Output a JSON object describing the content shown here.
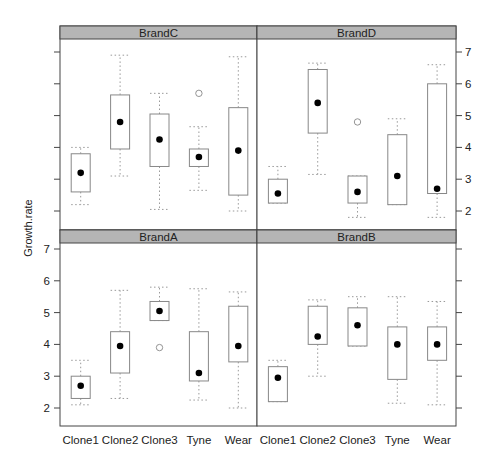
{
  "chart_data": {
    "type": "box",
    "title": "",
    "xlabel": "",
    "ylabel": "Growth.rate",
    "ylim": [
      1.7,
      7.3
    ],
    "yticks": [
      2,
      3,
      4,
      5,
      6,
      7
    ],
    "grid": false,
    "categories": [
      "Clone1",
      "Clone2",
      "Clone3",
      "Tyne",
      "Wear"
    ],
    "layout": "2x2 lattice panels (bwplot); top row: BrandC, BrandD; bottom row: BrandA, BrandB",
    "panels": [
      {
        "name": "BrandC",
        "row": 0,
        "col": 0,
        "boxes": [
          {
            "category": "Clone1",
            "low": 2.2,
            "q1": 2.6,
            "median": 3.2,
            "q3": 3.8,
            "high": 4.0,
            "outliers": []
          },
          {
            "category": "Clone2",
            "low": 3.1,
            "q1": 3.95,
            "median": 4.8,
            "q3": 5.65,
            "high": 6.9,
            "outliers": []
          },
          {
            "category": "Clone3",
            "low": 2.05,
            "q1": 3.4,
            "median": 4.25,
            "q3": 5.05,
            "high": 5.7,
            "outliers": []
          },
          {
            "category": "Tyne",
            "low": 2.65,
            "q1": 3.4,
            "median": 3.7,
            "q3": 3.95,
            "high": 4.65,
            "outliers": [
              5.7
            ]
          },
          {
            "category": "Wear",
            "low": 2.0,
            "q1": 2.5,
            "median": 3.9,
            "q3": 5.25,
            "high": 6.85,
            "outliers": []
          }
        ]
      },
      {
        "name": "BrandD",
        "row": 0,
        "col": 1,
        "boxes": [
          {
            "category": "Clone1",
            "low": 2.25,
            "q1": 2.25,
            "median": 2.55,
            "q3": 3.0,
            "high": 3.4,
            "outliers": []
          },
          {
            "category": "Clone2",
            "low": 3.15,
            "q1": 4.45,
            "median": 5.4,
            "q3": 6.45,
            "high": 6.65,
            "outliers": []
          },
          {
            "category": "Clone3",
            "low": 1.8,
            "q1": 2.25,
            "median": 2.6,
            "q3": 3.1,
            "high": 3.1,
            "outliers": [
              4.8
            ]
          },
          {
            "category": "Tyne",
            "low": 2.2,
            "q1": 2.2,
            "median": 3.1,
            "q3": 4.4,
            "high": 4.9,
            "outliers": []
          },
          {
            "category": "Wear",
            "low": 1.8,
            "q1": 2.55,
            "median": 2.7,
            "q3": 6.0,
            "high": 6.6,
            "outliers": []
          }
        ]
      },
      {
        "name": "BrandA",
        "row": 1,
        "col": 0,
        "boxes": [
          {
            "category": "Clone1",
            "low": 2.1,
            "q1": 2.3,
            "median": 2.7,
            "q3": 3.0,
            "high": 3.5,
            "outliers": []
          },
          {
            "category": "Clone2",
            "low": 2.3,
            "q1": 3.1,
            "median": 3.95,
            "q3": 4.4,
            "high": 5.7,
            "outliers": []
          },
          {
            "category": "Clone3",
            "low": 4.75,
            "q1": 4.75,
            "median": 5.05,
            "q3": 5.35,
            "high": 5.8,
            "outliers": [
              3.9
            ]
          },
          {
            "category": "Tyne",
            "low": 2.25,
            "q1": 2.85,
            "median": 3.1,
            "q3": 4.4,
            "high": 5.75,
            "outliers": []
          },
          {
            "category": "Wear",
            "low": 2.0,
            "q1": 3.45,
            "median": 3.95,
            "q3": 5.2,
            "high": 5.65,
            "outliers": []
          }
        ]
      },
      {
        "name": "BrandB",
        "row": 1,
        "col": 1,
        "boxes": [
          {
            "category": "Clone1",
            "low": 2.2,
            "q1": 2.2,
            "median": 2.95,
            "q3": 3.3,
            "high": 3.5,
            "outliers": []
          },
          {
            "category": "Clone2",
            "low": 3.0,
            "q1": 4.0,
            "median": 4.25,
            "q3": 5.2,
            "high": 5.4,
            "outliers": []
          },
          {
            "category": "Clone3",
            "low": 3.95,
            "q1": 3.95,
            "median": 4.6,
            "q3": 5.15,
            "high": 5.5,
            "outliers": []
          },
          {
            "category": "Tyne",
            "low": 2.15,
            "q1": 2.9,
            "median": 4.0,
            "q3": 4.55,
            "high": 5.5,
            "outliers": []
          },
          {
            "category": "Wear",
            "low": 2.1,
            "q1": 3.5,
            "median": 4.0,
            "q3": 4.55,
            "high": 5.35,
            "outliers": []
          }
        ]
      }
    ]
  },
  "axis": {
    "ylabel": "Growth.rate",
    "yticks": [
      "2",
      "3",
      "4",
      "5",
      "6",
      "7"
    ],
    "xticks": [
      "Clone1",
      "Clone2",
      "Clone3",
      "Tyne",
      "Wear"
    ]
  },
  "style": {
    "strip_fill": "#b5b5b5",
    "box_stroke": "#888888",
    "whisker_stroke": "#999999",
    "median_dot": "#000000",
    "frame": "#444444"
  }
}
